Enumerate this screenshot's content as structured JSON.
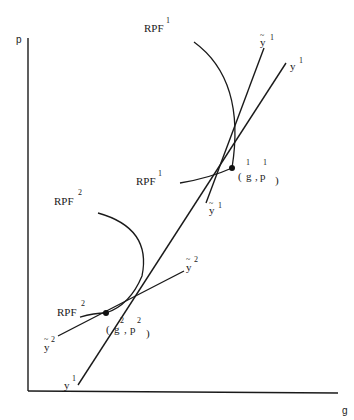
{
  "axes": {
    "y_label": "p",
    "x_label": "g"
  },
  "labels": {
    "rpf1_top": {
      "base": "RPF",
      "sup": "1"
    },
    "rpf1_mid": {
      "base": "RPF",
      "sup": "1"
    },
    "rpf2_top": {
      "base": "RPF",
      "sup": "2"
    },
    "rpf2_low": {
      "base": "RPF",
      "sup": "2"
    },
    "ytilde1_top": {
      "base": "y",
      "sup": "1",
      "accent": "~"
    },
    "y1_right": {
      "base": "y",
      "sup": "1"
    },
    "ytilde1_mid": {
      "base": "y",
      "sup": "1",
      "accent": "~"
    },
    "ytilde2_right": {
      "base": "y",
      "sup": "2",
      "accent": "~"
    },
    "ytilde2_left": {
      "base": "y",
      "sup": "2",
      "accent": "~"
    },
    "y1_bottom": {
      "base": "y",
      "sup": "1"
    },
    "point1": {
      "open": "(",
      "g": "g",
      "g_sup": "1",
      "comma": ",",
      "p": "p",
      "p_sup": "1",
      "close": ")"
    },
    "point2": {
      "open": "(",
      "g": "g",
      "g_sup": "2",
      "comma": ",",
      "p": "p",
      "p_sup": "2",
      "close": ")"
    }
  }
}
